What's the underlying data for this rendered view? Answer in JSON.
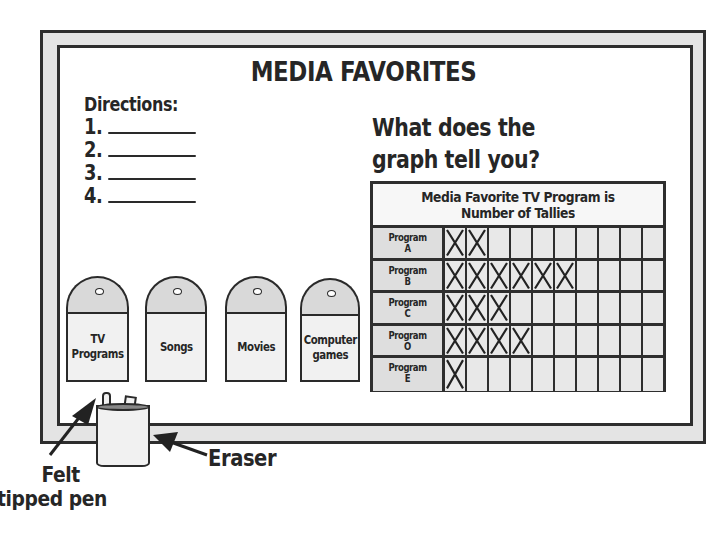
{
  "board": {
    "title": "MEDIA FAVORITES",
    "directions": {
      "heading": "Directions:",
      "items": [
        "1.",
        "2.",
        "3.",
        "4."
      ]
    },
    "question": {
      "line1": "What does the",
      "line2": "graph tell you?"
    },
    "jars": [
      {
        "label_line1": "TV",
        "label_line2": "Programs"
      },
      {
        "label_line1": "Songs",
        "label_line2": ""
      },
      {
        "label_line1": "Movies",
        "label_line2": ""
      },
      {
        "label_line1": "Computer",
        "label_line2": "games"
      }
    ],
    "tray": {
      "pen_label_line1": "Felt",
      "pen_label_line2": "tipped pen",
      "eraser_label": "Eraser"
    }
  },
  "chart_data": {
    "type": "table",
    "title_line1": "Media Favorite TV Program is",
    "title_line2": "Number of Tallies",
    "columns": 10,
    "categories": [
      "Program A",
      "Program B",
      "Program C",
      "Program O",
      "Program E"
    ],
    "rows": [
      {
        "label_line1": "Program",
        "label_line2": "A",
        "tallies": 2
      },
      {
        "label_line1": "Program",
        "label_line2": "B",
        "tallies": 6
      },
      {
        "label_line1": "Program",
        "label_line2": "C",
        "tallies": 3
      },
      {
        "label_line1": "Program",
        "label_line2": "O",
        "tallies": 4
      },
      {
        "label_line1": "Program",
        "label_line2": "E",
        "tallies": 1
      }
    ],
    "values": [
      2,
      6,
      3,
      4,
      1
    ],
    "tally_mark": "X"
  },
  "colors": {
    "frame": "#e4e4e4",
    "outline": "#2e2e2e",
    "label_cells": "#dedede",
    "jar_cap": "#d9d9d9",
    "jar_body": "#f1f1f1"
  }
}
